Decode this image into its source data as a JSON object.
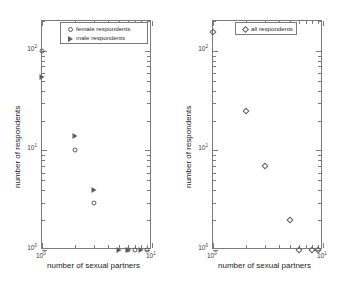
{
  "figure": {
    "background": "#ffffff",
    "axis_color": "#7a7a7a",
    "marker_color": "#5f5f5f"
  },
  "panels": {
    "left": {
      "xlabel": "number of sexual partners",
      "ylabel": "number of respondents",
      "xticklabels": [
        "10",
        "10"
      ],
      "xtickexp": [
        "0",
        "1"
      ],
      "yticklabels": [
        "10",
        "10",
        "10"
      ],
      "ytickexp": [
        "2",
        "1",
        "0"
      ],
      "legend": [
        {
          "label": "female respondents",
          "marker": "circle-marker"
        },
        {
          "label": "male respondents",
          "marker": "triangle-marker"
        }
      ]
    },
    "right": {
      "xlabel": "number of sexual partners",
      "ylabel": "number of respondents",
      "xticklabels": [
        "10",
        "10"
      ],
      "xtickexp": [
        "0",
        "1"
      ],
      "yticklabels": [
        "10",
        "10",
        "10"
      ],
      "ytickexp": [
        "2",
        "1",
        "0"
      ],
      "legend": [
        {
          "label": "all respondents",
          "marker": "diamond-marker"
        }
      ]
    }
  },
  "chart_data": [
    {
      "type": "scatter",
      "title": "",
      "panel": "left",
      "xlabel": "number of sexual partners",
      "ylabel": "number of respondents",
      "xscale": "log",
      "yscale": "log",
      "xlim": [
        1,
        10
      ],
      "ylim": [
        1,
        200
      ],
      "grid": false,
      "legend_position": "top-right",
      "series": [
        {
          "name": "female respondents",
          "marker": "circle",
          "x": [
            1,
            2,
            3,
            6,
            7,
            9
          ],
          "y": [
            100,
            10,
            3,
            1,
            1,
            1
          ]
        },
        {
          "name": "male respondents",
          "marker": "triangle",
          "x": [
            1,
            2,
            3,
            5,
            6,
            8
          ],
          "y": [
            55,
            14,
            4,
            1,
            1,
            1
          ]
        }
      ]
    },
    {
      "type": "scatter",
      "title": "",
      "panel": "right",
      "xlabel": "number of sexual partners",
      "ylabel": "number of respondents",
      "xscale": "log",
      "yscale": "log",
      "xlim": [
        1,
        10
      ],
      "ylim": [
        1,
        200
      ],
      "grid": false,
      "legend_position": "top-right",
      "series": [
        {
          "name": "all respondents",
          "marker": "diamond",
          "x": [
            1,
            2,
            3,
            5,
            6,
            8,
            9
          ],
          "y": [
            155,
            25,
            7,
            2,
            1,
            1,
            1
          ]
        }
      ]
    }
  ]
}
